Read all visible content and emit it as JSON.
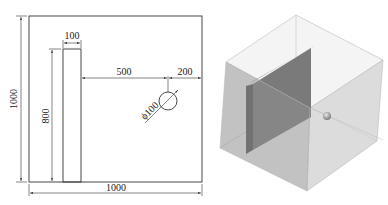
{
  "drawing": {
    "outer_width_label": "1000",
    "outer_height_label": "1000",
    "plate_width_label": "100",
    "plate_height_label": "800",
    "gap_label": "500",
    "edge_offset_label": "200",
    "hole_diameter_label": "ϕ100"
  },
  "colors": {
    "line": "#333333",
    "cube_face_left": "#a9a9a9",
    "cube_face_right": "#d4d4d4",
    "cube_face_top": "#f2f2f2",
    "plate_front": "#5a5a5a",
    "plate_side": "#8c8c8c",
    "sphere": "#9a9a9a"
  }
}
